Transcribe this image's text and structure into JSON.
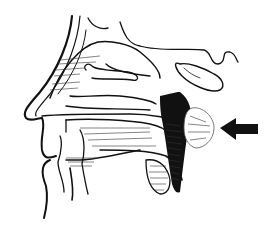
{
  "figure": {
    "type": "anatomical-illustration",
    "annotation": {
      "kind": "arrow",
      "direction": "left",
      "points_to": "highlighted mass in nasopharynx",
      "color": "#111111"
    },
    "colors": {
      "line": "#111111",
      "background": "#ffffff",
      "shading": "#000000"
    }
  }
}
